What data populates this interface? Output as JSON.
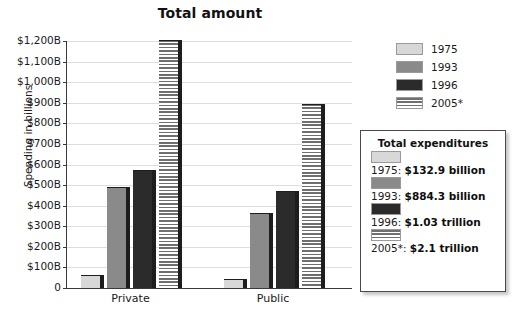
{
  "chart_data": {
    "type": "bar",
    "title": "Total amount",
    "xlabel": "",
    "ylabel": "Spending in billions",
    "categories": [
      "Private",
      "Public"
    ],
    "series": [
      {
        "name": "1975",
        "values": [
          65,
          45
        ]
      },
      {
        "name": "1993",
        "values": [
          490,
          365
        ]
      },
      {
        "name": "1996",
        "values": [
          575,
          470
        ]
      },
      {
        "name": "2005*",
        "values": [
          1205,
          895
        ]
      }
    ],
    "ylim": [
      0,
      1200
    ],
    "ytick_values": [
      0,
      100,
      200,
      300,
      400,
      500,
      600,
      700,
      800,
      900,
      1000,
      1100,
      1200
    ],
    "ytick_labels": [
      "0",
      "$100B",
      "$200B",
      "$300B",
      "$400B",
      "$500B",
      "$600B",
      "$700B",
      "$800B",
      "$900B",
      "$1,000B",
      "$1,100B",
      "$1,200B"
    ],
    "grid": true,
    "legend_position": "right-top",
    "series_colors": [
      "#d8d8d8",
      "#8a8a8a",
      "#2b2b2b",
      "#6f6f6f"
    ],
    "series_patterns": [
      "solid",
      "solid",
      "solid",
      "horizontal-stripes"
    ]
  },
  "legend": {
    "items": [
      {
        "label": "1975",
        "pattern": "solid",
        "color": "#d8d8d8"
      },
      {
        "label": "1993",
        "pattern": "solid",
        "color": "#8a8a8a"
      },
      {
        "label": "1996",
        "pattern": "solid",
        "color": "#2b2b2b"
      },
      {
        "label": "2005*",
        "pattern": "horizontal-stripes",
        "color": "#6f6f6f"
      }
    ]
  },
  "expenditures": {
    "title": "Total expenditures",
    "rows": [
      {
        "year": "1975:",
        "value": "$132.9 billion",
        "pattern": "solid",
        "color": "#d8d8d8"
      },
      {
        "year": "1993:",
        "value": "$884.3 billion",
        "pattern": "solid",
        "color": "#8a8a8a"
      },
      {
        "year": "1996:",
        "value": "$1.03 trillion",
        "pattern": "solid",
        "color": "#2b2b2b"
      },
      {
        "year": "2005*:",
        "value": "$2.1 trillion",
        "pattern": "horizontal-stripes",
        "color": "#6f6f6f"
      }
    ]
  }
}
